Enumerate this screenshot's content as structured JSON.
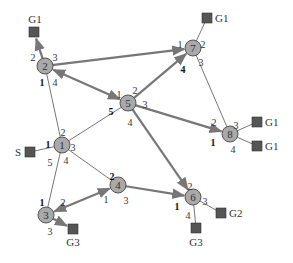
{
  "diagram": {
    "type": "network-graph",
    "colors": {
      "node_fill": "#a9a9a9",
      "node_stroke": "#555555",
      "terminal_fill": "#555555",
      "edge": "#777777",
      "thick_edge": "#777777",
      "text": "#333333"
    },
    "nodes": [
      {
        "id": "1",
        "label": "1",
        "x": 62,
        "y": 145
      },
      {
        "id": "2",
        "label": "2",
        "x": 45,
        "y": 66
      },
      {
        "id": "3",
        "label": "3",
        "x": 46,
        "y": 215
      },
      {
        "id": "4",
        "label": "4",
        "x": 118,
        "y": 185
      },
      {
        "id": "5",
        "label": "5",
        "x": 128,
        "y": 103
      },
      {
        "id": "6",
        "label": "6",
        "x": 193,
        "y": 197
      },
      {
        "id": "7",
        "label": "7",
        "x": 193,
        "y": 48
      },
      {
        "id": "8",
        "label": "8",
        "x": 230,
        "y": 134
      }
    ],
    "terminals": [
      {
        "id": "t_g1_a",
        "label": "G1",
        "x": 34,
        "y": 32,
        "label_x": 35,
        "label_y": 23,
        "anchor": "middle"
      },
      {
        "id": "t_g1_b",
        "label": "G1",
        "x": 207,
        "y": 18,
        "label_x": 215,
        "label_y": 22,
        "anchor": "start"
      },
      {
        "id": "t_g1_c",
        "label": "G1",
        "x": 257,
        "y": 122,
        "label_x": 265,
        "label_y": 126,
        "anchor": "start"
      },
      {
        "id": "t_g1_d",
        "label": "G1",
        "x": 257,
        "y": 146,
        "label_x": 265,
        "label_y": 150,
        "anchor": "start"
      },
      {
        "id": "t_s",
        "label": "S",
        "x": 30,
        "y": 152,
        "label_x": 21,
        "label_y": 156,
        "anchor": "end"
      },
      {
        "id": "t_g3_a",
        "label": "G3",
        "x": 73,
        "y": 229,
        "label_x": 73,
        "label_y": 246,
        "anchor": "middle"
      },
      {
        "id": "t_g2",
        "label": "G2",
        "x": 221,
        "y": 213,
        "label_x": 229,
        "label_y": 217,
        "anchor": "start"
      },
      {
        "id": "t_g3_b",
        "label": "G3",
        "x": 196,
        "y": 228,
        "label_x": 196,
        "label_y": 246,
        "anchor": "middle"
      }
    ],
    "edges": [
      {
        "from": "2",
        "to": "t_g1_a",
        "thick": true,
        "arrow_end": true,
        "arrow_start": false
      },
      {
        "from": "2",
        "to": "5",
        "thick": true,
        "arrow_end": true,
        "arrow_start": true
      },
      {
        "from": "2",
        "to": "7",
        "thick": true,
        "arrow_end": true,
        "arrow_start": false
      },
      {
        "from": "2",
        "to": "1",
        "thick": false,
        "arrow_end": false,
        "arrow_start": false
      },
      {
        "from": "5",
        "to": "7",
        "thick": true,
        "arrow_end": true,
        "arrow_start": false
      },
      {
        "from": "5",
        "to": "8",
        "thick": true,
        "arrow_end": true,
        "arrow_start": false
      },
      {
        "from": "5",
        "to": "6",
        "thick": true,
        "arrow_end": true,
        "arrow_start": false
      },
      {
        "from": "1",
        "to": "5",
        "thick": false,
        "arrow_end": false,
        "arrow_start": false
      },
      {
        "from": "1",
        "to": "t_s",
        "thick": false,
        "arrow_end": false,
        "arrow_start": false
      },
      {
        "from": "1",
        "to": "4",
        "thick": false,
        "arrow_end": false,
        "arrow_start": false
      },
      {
        "from": "1",
        "to": "3",
        "thick": false,
        "arrow_end": false,
        "arrow_start": false
      },
      {
        "from": "4",
        "to": "3",
        "thick": true,
        "arrow_end": true,
        "arrow_start": true
      },
      {
        "from": "4",
        "to": "6",
        "thick": true,
        "arrow_end": true,
        "arrow_start": false
      },
      {
        "from": "3",
        "to": "t_g3_a",
        "thick": true,
        "arrow_end": true,
        "arrow_start": false
      },
      {
        "from": "7",
        "to": "t_g1_b",
        "thick": false,
        "arrow_end": false,
        "arrow_start": false
      },
      {
        "from": "7",
        "to": "8",
        "thick": false,
        "arrow_end": false,
        "arrow_start": false
      },
      {
        "from": "8",
        "to": "t_g1_c",
        "thick": false,
        "arrow_end": false,
        "arrow_start": false
      },
      {
        "from": "8",
        "to": "t_g1_d",
        "thick": false,
        "arrow_end": false,
        "arrow_start": false
      },
      {
        "from": "6",
        "to": "t_g2",
        "thick": false,
        "arrow_end": false,
        "arrow_start": false
      },
      {
        "from": "6",
        "to": "t_g3_b",
        "thick": false,
        "arrow_end": false,
        "arrow_start": false
      }
    ],
    "port_labels": [
      {
        "node": "2",
        "text": "2",
        "x": 33,
        "y": 58,
        "bold": false
      },
      {
        "node": "2",
        "text": "3",
        "x": 55,
        "y": 58,
        "bold": false
      },
      {
        "node": "2",
        "text": "1",
        "x": 42,
        "y": 83,
        "bold": true
      },
      {
        "node": "2",
        "text": "4",
        "x": 55,
        "y": 83,
        "bold": false
      },
      {
        "node": "7",
        "text": "1",
        "x": 180,
        "y": 45,
        "bold": false
      },
      {
        "node": "7",
        "text": "2",
        "x": 203,
        "y": 45,
        "bold": false
      },
      {
        "node": "7",
        "text": "3",
        "x": 201,
        "y": 63,
        "bold": false
      },
      {
        "node": "7",
        "text": "4",
        "x": 183,
        "y": 70,
        "bold": true
      },
      {
        "node": "5",
        "text": "1",
        "x": 119,
        "y": 95,
        "bold": false
      },
      {
        "node": "5",
        "text": "2",
        "x": 135,
        "y": 91,
        "bold": false
      },
      {
        "node": "5",
        "text": "3",
        "x": 145,
        "y": 105,
        "bold": false
      },
      {
        "node": "5",
        "text": "4",
        "x": 130,
        "y": 123,
        "bold": false
      },
      {
        "node": "5",
        "text": "5",
        "x": 111,
        "y": 112,
        "bold": true
      },
      {
        "node": "1",
        "text": "1",
        "x": 48,
        "y": 145,
        "bold": true
      },
      {
        "node": "1",
        "text": "2",
        "x": 63,
        "y": 133,
        "bold": false
      },
      {
        "node": "1",
        "text": "3",
        "x": 73,
        "y": 148,
        "bold": false
      },
      {
        "node": "1",
        "text": "4",
        "x": 66,
        "y": 161,
        "bold": false
      },
      {
        "node": "1",
        "text": "5",
        "x": 50,
        "y": 163,
        "bold": false
      },
      {
        "node": "8",
        "text": "1",
        "x": 213,
        "y": 143,
        "bold": true
      },
      {
        "node": "8",
        "text": "2",
        "x": 214,
        "y": 123,
        "bold": false
      },
      {
        "node": "8",
        "text": "3",
        "x": 236,
        "y": 126,
        "bold": false
      },
      {
        "node": "8",
        "text": "4",
        "x": 233,
        "y": 150,
        "bold": false
      },
      {
        "node": "4",
        "text": "2",
        "x": 112,
        "y": 177,
        "bold": true
      },
      {
        "node": "4",
        "text": "1",
        "x": 106,
        "y": 200,
        "bold": false
      },
      {
        "node": "4",
        "text": "3",
        "x": 126,
        "y": 201,
        "bold": false
      },
      {
        "node": "3",
        "text": "1",
        "x": 42,
        "y": 203,
        "bold": true
      },
      {
        "node": "3",
        "text": "2",
        "x": 63,
        "y": 203,
        "bold": false
      },
      {
        "node": "3",
        "text": "3",
        "x": 50,
        "y": 232,
        "bold": false
      },
      {
        "node": "6",
        "text": "2",
        "x": 190,
        "y": 187,
        "bold": false
      },
      {
        "node": "6",
        "text": "3",
        "x": 205,
        "y": 202,
        "bold": false
      },
      {
        "node": "6",
        "text": "1",
        "x": 177,
        "y": 207,
        "bold": true
      },
      {
        "node": "6",
        "text": "4",
        "x": 188,
        "y": 216,
        "bold": false
      }
    ]
  }
}
